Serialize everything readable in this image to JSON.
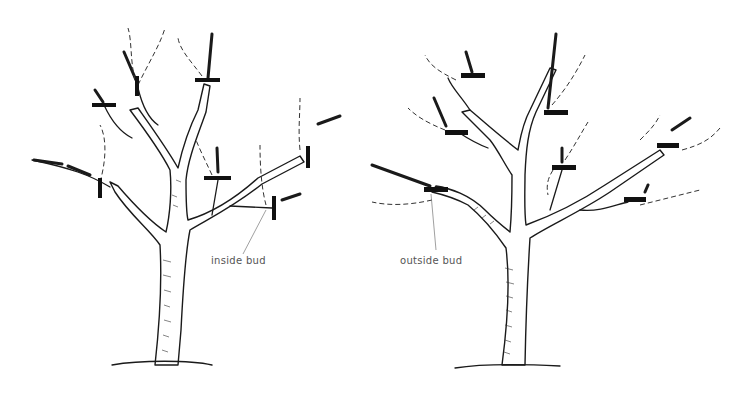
{
  "diagram": {
    "left_tree": {
      "label": "inside bud",
      "cut_count": 7
    },
    "right_tree": {
      "label": "outside bud",
      "cut_count": 7
    },
    "colors": {
      "ink": "#1a1a1a",
      "label": "#555555",
      "background": "#ffffff"
    }
  }
}
